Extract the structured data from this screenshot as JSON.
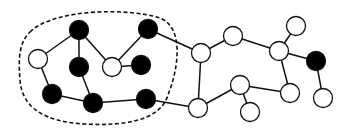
{
  "diagram": {
    "type": "graph",
    "width": 351,
    "height": 133,
    "node_radius": 9.5,
    "colors": {
      "background": "#ffffff",
      "stroke": "#111111",
      "filled": "#000000",
      "empty": "#ffffff"
    },
    "region": {
      "style": "dashed",
      "path": "M 30 32 C 55 8, 130 8, 160 18 C 185 28, 178 70, 168 95 C 160 122, 120 126, 85 124 C 45 122, 22 108, 20 80 C 18 55, 20 42, 30 32 Z"
    },
    "nodes": [
      {
        "id": "A",
        "x": 38,
        "y": 59,
        "filled": false
      },
      {
        "id": "B",
        "x": 79,
        "y": 30,
        "filled": true
      },
      {
        "id": "C",
        "x": 79,
        "y": 67,
        "filled": true
      },
      {
        "id": "D",
        "x": 112,
        "y": 67,
        "filled": false
      },
      {
        "id": "E",
        "x": 148,
        "y": 29,
        "filled": true
      },
      {
        "id": "F",
        "x": 141,
        "y": 65,
        "filled": true
      },
      {
        "id": "G",
        "x": 52,
        "y": 94,
        "filled": true
      },
      {
        "id": "H",
        "x": 93,
        "y": 103,
        "filled": true
      },
      {
        "id": "I",
        "x": 146,
        "y": 99,
        "filled": true
      },
      {
        "id": "J",
        "x": 201,
        "y": 53,
        "filled": false
      },
      {
        "id": "K",
        "x": 233,
        "y": 36,
        "filled": false
      },
      {
        "id": "L",
        "x": 279,
        "y": 51,
        "filled": false
      },
      {
        "id": "M",
        "x": 296,
        "y": 26,
        "filled": false
      },
      {
        "id": "N",
        "x": 316,
        "y": 61,
        "filled": true
      },
      {
        "id": "O",
        "x": 240,
        "y": 85,
        "filled": false
      },
      {
        "id": "P",
        "x": 290,
        "y": 93,
        "filled": false
      },
      {
        "id": "Q",
        "x": 323,
        "y": 98,
        "filled": false
      },
      {
        "id": "R",
        "x": 250,
        "y": 112,
        "filled": false
      },
      {
        "id": "S",
        "x": 198,
        "y": 108,
        "filled": false
      }
    ],
    "edges": [
      [
        "A",
        "B"
      ],
      [
        "B",
        "C"
      ],
      [
        "B",
        "D"
      ],
      [
        "A",
        "G"
      ],
      [
        "C",
        "H"
      ],
      [
        "G",
        "H"
      ],
      [
        "H",
        "I"
      ],
      [
        "D",
        "E"
      ],
      [
        "D",
        "F"
      ],
      [
        "E",
        "J"
      ],
      [
        "I",
        "S"
      ],
      [
        "J",
        "K"
      ],
      [
        "J",
        "S"
      ],
      [
        "K",
        "L"
      ],
      [
        "L",
        "M"
      ],
      [
        "L",
        "N"
      ],
      [
        "L",
        "P"
      ],
      [
        "N",
        "Q"
      ],
      [
        "S",
        "O"
      ],
      [
        "O",
        "P"
      ],
      [
        "O",
        "R"
      ]
    ]
  }
}
